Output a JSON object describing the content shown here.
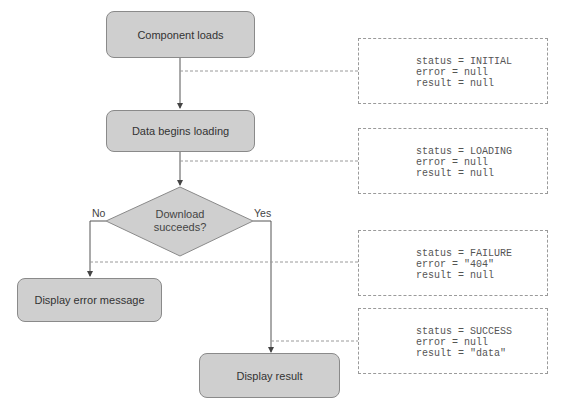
{
  "diagram": {
    "nodes": {
      "component_loads": "Component loads",
      "data_begins_loading": "Data begins loading",
      "decision": {
        "line1": "Download",
        "line2": "succeeds?"
      },
      "display_error": "Display error message",
      "display_result": "Display result"
    },
    "branches": {
      "no": "No",
      "yes": "Yes"
    },
    "states": [
      {
        "status": "status = INITIAL",
        "error": "error = null",
        "result": "result = null"
      },
      {
        "status": "status = LOADING",
        "error": "error = null",
        "result": "result = null"
      },
      {
        "status": "status = FAILURE",
        "error": "error = \"404\"",
        "result": "result = null"
      },
      {
        "status": "status = SUCCESS",
        "error": "error = null",
        "result": "result = \"data\""
      }
    ],
    "colors": {
      "node_fill": "#cfcfcf",
      "node_border": "#8a8a8a",
      "line": "#555555",
      "dashed": "#9a9a9a"
    }
  }
}
